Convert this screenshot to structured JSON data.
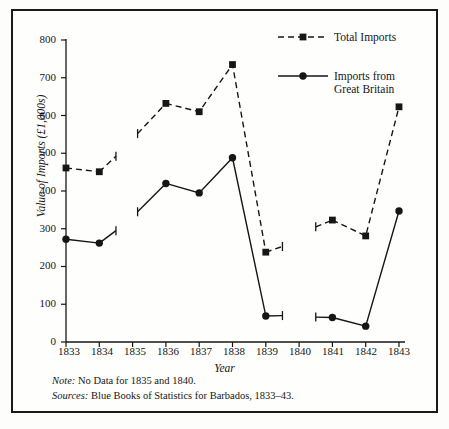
{
  "figure": {
    "frame_color": "#1a1a1a",
    "background": "#fefefd",
    "ink_color": "#161616"
  },
  "axis": {
    "ylabel": "Value of Imports (£1,000s)",
    "xlabel": "Year",
    "yticks": [
      "0",
      "100",
      "200",
      "300",
      "400",
      "500",
      "600",
      "700",
      "800"
    ],
    "xticks": [
      "1833",
      "1834",
      "1835",
      "1836",
      "1837",
      "1838",
      "1839",
      "1840",
      "1841",
      "1842",
      "1843"
    ]
  },
  "legend": {
    "items": [
      {
        "label": "Total Imports",
        "style": "dashed",
        "marker": "square"
      },
      {
        "label": "Imports from\nGreat Britain",
        "style": "solid",
        "marker": "circle"
      }
    ]
  },
  "notes": {
    "note_prefix": "Note:",
    "note_text": " No Data for 1835 and 1840.",
    "sources_prefix": "Sources:",
    "sources_text": " Blue Books of Statistics for Barbados, 1833–43."
  },
  "chart_data": {
    "type": "line",
    "title": "",
    "xlabel": "Year",
    "ylabel": "Value of Imports (£1,000s)",
    "x": [
      1833,
      1834,
      1835,
      1836,
      1837,
      1838,
      1839,
      1840,
      1841,
      1842,
      1843
    ],
    "xlim": [
      1833,
      1843
    ],
    "ylim": [
      0,
      800
    ],
    "ytick_step": 100,
    "grid": false,
    "legend_position": "top-right",
    "missing_years": [
      1835,
      1840
    ],
    "series": [
      {
        "name": "Total Imports",
        "style": "dashed",
        "marker": "square",
        "color": "#161616",
        "values": [
          461,
          451,
          null,
          632,
          610,
          735,
          238,
          null,
          323,
          281,
          623
        ]
      },
      {
        "name": "Imports from Great Britain",
        "style": "solid",
        "marker": "circle",
        "color": "#161616",
        "values": [
          272,
          262,
          null,
          420,
          395,
          488,
          69,
          null,
          65,
          42,
          347
        ]
      }
    ],
    "gap_stub_endpoints": {
      "total_imports": [
        {
          "from_year": 1834,
          "to_year": 1834.5,
          "to_value": 492
        },
        {
          "from_year": 1835.15,
          "from_value": 552,
          "to_year": 1836
        },
        {
          "from_year": 1839,
          "to_year": 1839.5,
          "to_value": 253
        },
        {
          "from_year": 1840.5,
          "from_value": 305,
          "to_year": 1841
        }
      ],
      "imports_from_great_britain": [
        {
          "from_year": 1834,
          "to_year": 1834.5,
          "to_value": 295
        },
        {
          "from_year": 1835.15,
          "from_value": 345,
          "to_year": 1836
        },
        {
          "from_year": 1839,
          "to_year": 1839.5,
          "to_value": 70
        },
        {
          "from_year": 1840.5,
          "from_value": 66,
          "to_year": 1841
        }
      ]
    }
  }
}
